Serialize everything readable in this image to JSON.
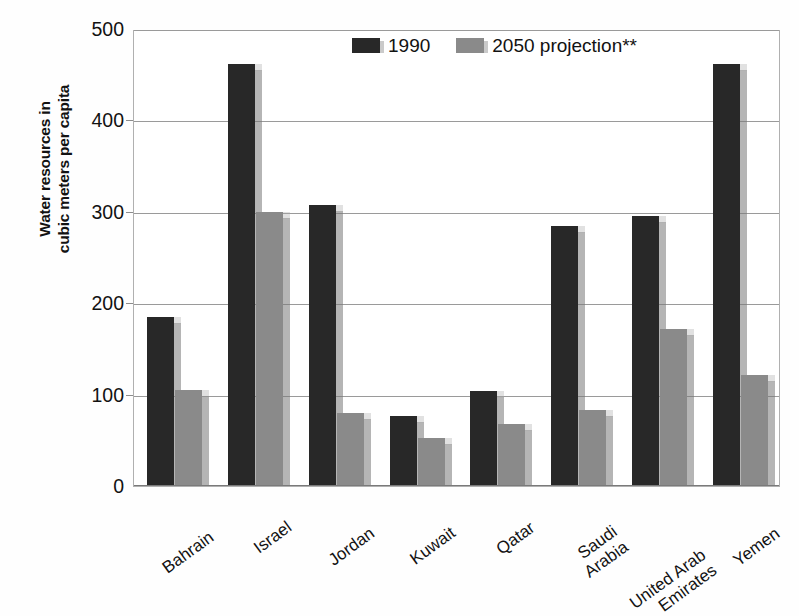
{
  "chart_data": {
    "type": "bar",
    "title": "",
    "subtitle": "",
    "xlabel": "",
    "ylabel": "Water resources in cubic meters per capita",
    "ylabel_lines": [
      "Water resources in",
      "cubic meters per capita"
    ],
    "ylim": [
      0,
      500
    ],
    "yticks": [
      0,
      100,
      200,
      300,
      400,
      500
    ],
    "ytick_labels": [
      "0",
      "100",
      "200",
      "300",
      "400",
      "500"
    ],
    "grid": true,
    "grid_axis": "y",
    "legend_position": "top-center",
    "categories": [
      "Bahrain",
      "Israel",
      "Jordan",
      "Kuwait",
      "Qatar",
      "Saudi Arabia",
      "United Arab Emirates",
      "Yemen"
    ],
    "category_label_lines": [
      [
        "Bahrain"
      ],
      [
        "Israel"
      ],
      [
        "Jordan"
      ],
      [
        "Kuwait"
      ],
      [
        "Qatar"
      ],
      [
        "Saudi",
        "Arabia"
      ],
      [
        "United Arab",
        "Emirates"
      ],
      [
        "Yemen"
      ]
    ],
    "series": [
      {
        "name": "1990",
        "color": "#282828",
        "values": [
          185,
          462,
          308,
          77,
          104,
          285,
          295,
          462
        ]
      },
      {
        "name": "2050 projection**",
        "color": "#8a8a8a",
        "values": [
          105,
          300,
          80,
          53,
          68,
          83,
          172,
          121
        ]
      }
    ]
  },
  "legend": {
    "items": [
      {
        "label": "1990",
        "color": "#282828"
      },
      {
        "label": "2050 projection**",
        "color": "#8a8a8a"
      }
    ]
  },
  "axes": {
    "y_title_line1": "Water resources in",
    "y_title_line2": "cubic meters per capita",
    "y_ticks": [
      "500",
      "400",
      "300",
      "200",
      "100",
      "0"
    ]
  },
  "colors": {
    "series_1990": "#282828",
    "series_2050": "#8a8a8a",
    "grid": "#9a9a9a",
    "frame": "#b0b0b0",
    "background": "#ffffff",
    "text": "#121212"
  }
}
